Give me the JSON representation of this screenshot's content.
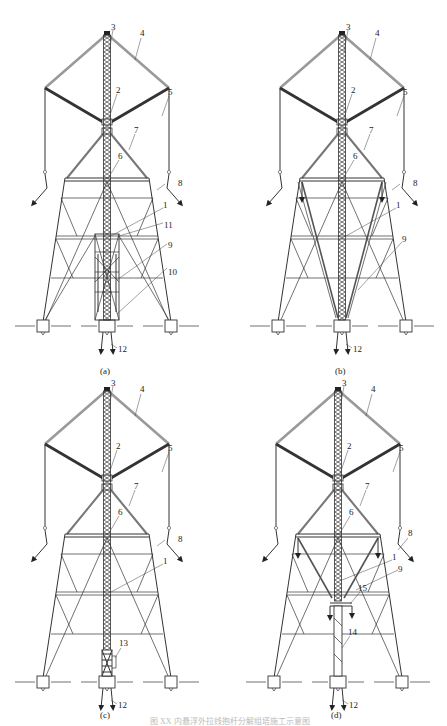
{
  "figure": {
    "panels": [
      {
        "id": "a",
        "caption": "(a)",
        "labels": [
          {
            "num": "1",
            "part": "inner lattice mast"
          },
          {
            "num": "2",
            "part": "lower boom"
          },
          {
            "num": "3",
            "part": "mast top"
          },
          {
            "num": "4",
            "part": "upper boom"
          },
          {
            "num": "5",
            "part": "hoist rope"
          },
          {
            "num": "6",
            "part": "tower crossarm waist"
          },
          {
            "num": "7",
            "part": "upper tower leg"
          },
          {
            "num": "8",
            "part": "guy wire"
          },
          {
            "num": "9",
            "part": "sling / bracing cable"
          },
          {
            "num": "10",
            "part": "lifting frame"
          },
          {
            "num": "11",
            "part": "outer frame"
          },
          {
            "num": "12",
            "part": "anchor"
          }
        ]
      },
      {
        "id": "b",
        "caption": "(b)",
        "labels": [
          {
            "num": "1"
          },
          {
            "num": "2"
          },
          {
            "num": "3"
          },
          {
            "num": "4"
          },
          {
            "num": "5"
          },
          {
            "num": "6"
          },
          {
            "num": "7"
          },
          {
            "num": "8"
          },
          {
            "num": "9"
          },
          {
            "num": "12"
          }
        ]
      },
      {
        "id": "c",
        "caption": "(c)",
        "labels": [
          {
            "num": "1"
          },
          {
            "num": "2"
          },
          {
            "num": "3"
          },
          {
            "num": "4"
          },
          {
            "num": "5"
          },
          {
            "num": "6"
          },
          {
            "num": "7"
          },
          {
            "num": "8"
          },
          {
            "num": "12"
          },
          {
            "num": "13"
          }
        ]
      },
      {
        "id": "d",
        "caption": "(d)",
        "labels": [
          {
            "num": "1"
          },
          {
            "num": "2"
          },
          {
            "num": "3"
          },
          {
            "num": "4"
          },
          {
            "num": "5"
          },
          {
            "num": "6"
          },
          {
            "num": "7"
          },
          {
            "num": "8"
          },
          {
            "num": "9"
          },
          {
            "num": "12"
          },
          {
            "num": "14"
          },
          {
            "num": "15"
          }
        ]
      }
    ],
    "footer_caption": "图  XX  内悬浮外拉线抱杆分解组塔施工示意图"
  },
  "text": {
    "a": {
      "l1": "1",
      "l2": "2",
      "l3": "3",
      "l4": "4",
      "l5": "5",
      "l6": "6",
      "l7": "7",
      "l8": "8",
      "l9": "9",
      "l10": "10",
      "l11": "11",
      "l12": "12",
      "cap": "(a)"
    },
    "b": {
      "l1": "1",
      "l2": "2",
      "l3": "3",
      "l4": "4",
      "l5": "5",
      "l6": "6",
      "l7": "7",
      "l8": "8",
      "l9": "9",
      "l12": "12",
      "cap": "(b)"
    },
    "c": {
      "l1": "1",
      "l2": "2",
      "l3": "3",
      "l4": "4",
      "l5": "5",
      "l6": "6",
      "l7": "7",
      "l8": "8",
      "l12": "12",
      "l13": "13",
      "cap": "(c)"
    },
    "d": {
      "l1": "1",
      "l2": "2",
      "l3": "3",
      "l4": "4",
      "l5": "5",
      "l6": "6",
      "l7": "7",
      "l8": "8",
      "l9": "9",
      "l12": "12",
      "l14": "14",
      "l15": "15",
      "cap": "(d)"
    }
  }
}
